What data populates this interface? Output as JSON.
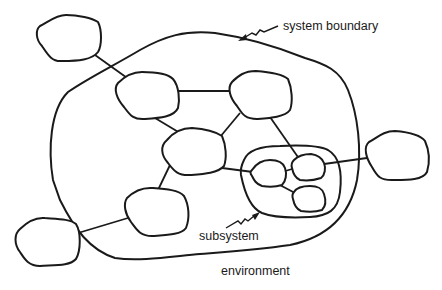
{
  "diagram": {
    "type": "system-environment-diagram",
    "labels": {
      "system_boundary": "system boundary",
      "subsystem": "subsystem",
      "environment": "environment"
    },
    "nodes": [
      {
        "id": "env-top-left",
        "region": "environment"
      },
      {
        "id": "env-right",
        "region": "environment"
      },
      {
        "id": "env-bottom-left",
        "region": "environment"
      },
      {
        "id": "sys-top-left",
        "region": "system"
      },
      {
        "id": "sys-top-right",
        "region": "system"
      },
      {
        "id": "sys-center",
        "region": "system"
      },
      {
        "id": "sys-bottom-left",
        "region": "system"
      },
      {
        "id": "sub-left",
        "region": "subsystem"
      },
      {
        "id": "sub-top-right",
        "region": "subsystem"
      },
      {
        "id": "sub-bottom-right",
        "region": "subsystem"
      }
    ],
    "edges": [
      [
        "env-top-left",
        "sys-top-left"
      ],
      [
        "sys-top-left",
        "sys-top-right"
      ],
      [
        "sys-top-left",
        "sys-center"
      ],
      [
        "sys-top-right",
        "sys-center"
      ],
      [
        "sys-top-right",
        "sub-top-right"
      ],
      [
        "sys-center",
        "sys-bottom-left"
      ],
      [
        "sys-center",
        "sub-left"
      ],
      [
        "sys-bottom-left",
        "env-bottom-left"
      ],
      [
        "sub-left",
        "sub-top-right"
      ],
      [
        "sub-left",
        "sub-bottom-right"
      ],
      [
        "sub-top-right",
        "env-right"
      ]
    ],
    "colors": {
      "stroke": "#1a1a1a",
      "background": "#ffffff"
    }
  }
}
